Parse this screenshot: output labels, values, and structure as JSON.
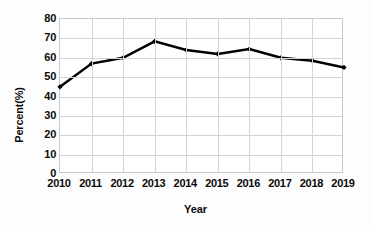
{
  "chart_data": {
    "type": "line",
    "title": "",
    "xlabel": "Year",
    "ylabel": "Percent(%)",
    "categories": [
      "2010",
      "2011",
      "2012",
      "2013",
      "2014",
      "2015",
      "2016",
      "2017",
      "2018",
      "2019"
    ],
    "values": [
      45,
      57,
      60,
      68.5,
      64,
      62,
      64.5,
      60,
      58.5,
      55
    ],
    "series": [
      {
        "name": "Percent",
        "values": [
          45,
          57,
          60,
          68.5,
          64,
          62,
          64.5,
          60,
          58.5,
          55
        ],
        "color": "#000000",
        "marker": "diamond",
        "line_width": 2.5
      }
    ],
    "ylim": [
      0,
      80
    ],
    "ytick_step": 10,
    "yticks": [
      80,
      70,
      60,
      50,
      40,
      30,
      20,
      10,
      0
    ],
    "xticks": [
      "2010",
      "2011",
      "2012",
      "2013",
      "2014",
      "2015",
      "2016",
      "2017",
      "2018",
      "2019"
    ],
    "grid": {
      "horizontal": true,
      "vertical": true,
      "color": "#d4d4d4"
    },
    "legend": {
      "visible": false,
      "position": "none"
    },
    "plot_border_color": "#c9c9c9",
    "background_color": "#ffffff",
    "text_color": "#0a0a0a"
  }
}
